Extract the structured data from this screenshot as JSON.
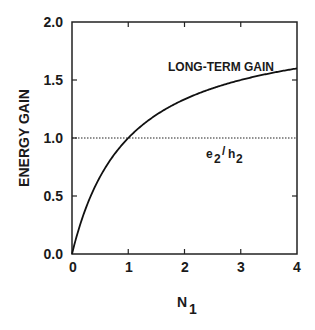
{
  "chart_data": {
    "type": "line",
    "title": "",
    "xlabel": "N",
    "xlabel_sub": "1",
    "ylabel": "ENERGY GAIN",
    "xlim": [
      0,
      4
    ],
    "ylim": [
      0.0,
      2.0
    ],
    "x_ticks": [
      "0",
      "1",
      "2",
      "3",
      "4"
    ],
    "y_ticks": [
      "0.0",
      "0.5",
      "1.0",
      "1.5",
      "2.0"
    ],
    "grid": false,
    "series": [
      {
        "name": "LONG-TERM GAIN",
        "style": "solid",
        "x": [
          0,
          0.25,
          0.5,
          0.75,
          1,
          1.5,
          2,
          2.5,
          3,
          3.5,
          4
        ],
        "y": [
          0,
          0.4,
          0.67,
          0.86,
          1.0,
          1.2,
          1.33,
          1.43,
          1.5,
          1.56,
          1.6
        ]
      },
      {
        "name": "e2/h2",
        "style": "dotted",
        "x": [
          0,
          4
        ],
        "y": [
          1.0,
          1.0
        ]
      }
    ],
    "annotations": [
      {
        "text": "LONG-TERM GAIN",
        "x": 2.6,
        "y": 1.7
      },
      {
        "text": "e2/h2",
        "x": 3.0,
        "y": 0.85
      }
    ]
  },
  "labels": {
    "long_term": "LONG-TERM GAIN",
    "ratio_e": "e",
    "ratio_sub1": "2",
    "ratio_slash": "/",
    "ratio_h": "h",
    "ratio_sub2": "2",
    "x_main": "N",
    "x_sub": "1",
    "y_axis": "ENERGY GAIN"
  }
}
